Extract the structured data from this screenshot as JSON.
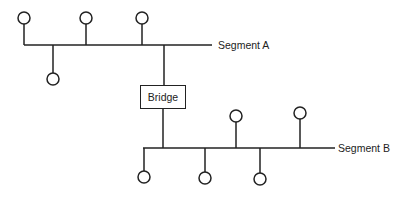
{
  "diagram": {
    "segments": [
      {
        "label": "Segment A"
      },
      {
        "label": "Segment B"
      }
    ],
    "bridge": {
      "label": "Bridge"
    },
    "colors": {
      "line": "#222222",
      "background": "#ffffff"
    }
  }
}
